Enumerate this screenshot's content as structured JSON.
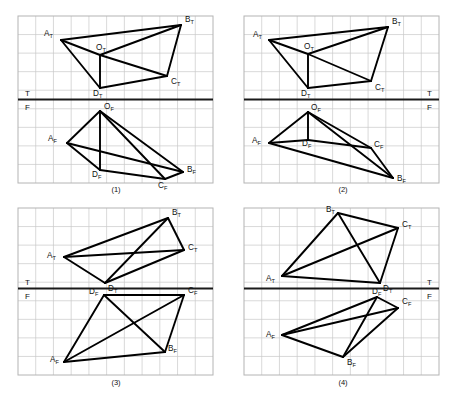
{
  "figure": {
    "type": "engineering-drawing",
    "background_color": "#ffffff",
    "grid_color": "#c8c8c8",
    "line_color": "#000000",
    "ground_line_color": "#1a1a1a"
  },
  "panels": [
    {
      "id": "panel-1",
      "caption": "(1)",
      "caption_pos": {
        "x": 116,
        "y": 192
      },
      "frame": {
        "x": 18,
        "y": 16,
        "w": 195,
        "h": 167
      },
      "grid": {
        "cols": 11,
        "rows": 9
      },
      "ground_line": {
        "x1": 18,
        "y1": 99.5,
        "x2": 213,
        "y2": 99.5
      },
      "tf_labels": [
        {
          "text": "T",
          "x": 25,
          "y": 96
        },
        {
          "text": "F",
          "x": 25,
          "y": 110
        }
      ],
      "top_view": {
        "points": {
          "A_T": {
            "x": 61,
            "y": 40
          },
          "B_T": {
            "x": 181,
            "y": 25
          },
          "C_T": {
            "x": 167,
            "y": 76
          },
          "D_T": {
            "x": 100,
            "y": 88
          },
          "O_T": {
            "x": 100,
            "y": 55
          }
        },
        "edges": [
          [
            "A_T",
            "B_T"
          ],
          [
            "B_T",
            "C_T"
          ],
          [
            "C_T",
            "D_T"
          ],
          [
            "D_T",
            "A_T"
          ],
          [
            "A_T",
            "O_T"
          ],
          [
            "B_T",
            "O_T"
          ],
          [
            "C_T",
            "O_T"
          ],
          [
            "D_T",
            "O_T"
          ]
        ],
        "labels": [
          {
            "key": "A_T",
            "base": "A",
            "sub": "T",
            "x": 44,
            "y": 36
          },
          {
            "key": "B_T",
            "base": "B",
            "sub": "T",
            "x": 185,
            "y": 22
          },
          {
            "key": "C_T",
            "base": "C",
            "sub": "T",
            "x": 171,
            "y": 84
          },
          {
            "key": "D_T",
            "base": "D",
            "sub": "T",
            "x": 93,
            "y": 96
          },
          {
            "key": "O_T",
            "base": "O",
            "sub": "T",
            "x": 96,
            "y": 50
          }
        ]
      },
      "front_view": {
        "points": {
          "A_F": {
            "x": 67,
            "y": 143
          },
          "B_F": {
            "x": 183,
            "y": 172
          },
          "C_F": {
            "x": 165,
            "y": 179
          },
          "D_F": {
            "x": 100,
            "y": 170
          },
          "O_F": {
            "x": 100,
            "y": 111
          }
        },
        "edges": [
          [
            "A_F",
            "B_F"
          ],
          [
            "B_F",
            "C_F"
          ],
          [
            "C_F",
            "D_F"
          ],
          [
            "D_F",
            "A_F"
          ],
          [
            "A_F",
            "O_F"
          ],
          [
            "B_F",
            "O_F"
          ],
          [
            "C_F",
            "O_F"
          ],
          [
            "D_F",
            "O_F"
          ]
        ],
        "labels": [
          {
            "key": "A_F",
            "base": "A",
            "sub": "F",
            "x": 48,
            "y": 141
          },
          {
            "key": "B_F",
            "base": "B",
            "sub": "F",
            "x": 187,
            "y": 172
          },
          {
            "key": "C_F",
            "base": "C",
            "sub": "F",
            "x": 158,
            "y": 188
          },
          {
            "key": "D_F",
            "base": "D",
            "sub": "F",
            "x": 92,
            "y": 177
          },
          {
            "key": "O_F",
            "base": "O",
            "sub": "F",
            "x": 104,
            "y": 109
          }
        ]
      }
    },
    {
      "id": "panel-2",
      "caption": "(2)",
      "caption_pos": {
        "x": 343,
        "y": 192
      },
      "frame": {
        "x": 244,
        "y": 16,
        "w": 195,
        "h": 167
      },
      "grid": {
        "cols": 11,
        "rows": 9
      },
      "ground_line": {
        "x1": 244,
        "y1": 99.5,
        "x2": 439,
        "y2": 99.5
      },
      "tf_labels": [
        {
          "text": "T",
          "x": 427,
          "y": 96
        },
        {
          "text": "F",
          "x": 427,
          "y": 110
        }
      ],
      "top_view": {
        "points": {
          "A_T": {
            "x": 269,
            "y": 40
          },
          "B_T": {
            "x": 388,
            "y": 27
          },
          "C_T": {
            "x": 371,
            "y": 81
          },
          "D_T": {
            "x": 308,
            "y": 88
          },
          "O_T": {
            "x": 308,
            "y": 54
          }
        },
        "edges": [
          [
            "A_T",
            "B_T"
          ],
          [
            "B_T",
            "C_T"
          ],
          [
            "C_T",
            "D_T"
          ],
          [
            "D_T",
            "A_T"
          ],
          [
            "A_T",
            "O_T"
          ],
          [
            "B_T",
            "O_T"
          ],
          [
            "C_T",
            "O_T"
          ],
          [
            "D_T",
            "O_T"
          ]
        ],
        "labels": [
          {
            "key": "A_T",
            "base": "A",
            "sub": "T",
            "x": 253,
            "y": 37
          },
          {
            "key": "B_T",
            "base": "B",
            "sub": "T",
            "x": 392,
            "y": 24
          },
          {
            "key": "C_T",
            "base": "C",
            "sub": "T",
            "x": 375,
            "y": 90
          },
          {
            "key": "D_T",
            "base": "D",
            "sub": "T",
            "x": 301,
            "y": 96
          },
          {
            "key": "O_T",
            "base": "O",
            "sub": "T",
            "x": 304,
            "y": 49
          }
        ]
      },
      "front_view": {
        "points": {
          "A_F": {
            "x": 269,
            "y": 143
          },
          "B_F": {
            "x": 393,
            "y": 178
          },
          "C_F": {
            "x": 371,
            "y": 148
          },
          "D_F": {
            "x": 308,
            "y": 140
          },
          "O_F": {
            "x": 308,
            "y": 112
          }
        },
        "edges": [
          [
            "A_F",
            "B_F"
          ],
          [
            "B_F",
            "C_F"
          ],
          [
            "C_F",
            "D_F"
          ],
          [
            "D_F",
            "A_F"
          ],
          [
            "A_F",
            "O_F"
          ],
          [
            "B_F",
            "O_F"
          ],
          [
            "C_F",
            "O_F"
          ],
          [
            "D_F",
            "O_F"
          ]
        ],
        "labels": [
          {
            "key": "A_F",
            "base": "A",
            "sub": "F",
            "x": 252,
            "y": 143
          },
          {
            "key": "B_F",
            "base": "B",
            "sub": "F",
            "x": 397,
            "y": 181
          },
          {
            "key": "C_F",
            "base": "C",
            "sub": "F",
            "x": 374,
            "y": 147
          },
          {
            "key": "D_F",
            "base": "D",
            "sub": "F",
            "x": 302,
            "y": 146
          },
          {
            "key": "O_F",
            "base": "O",
            "sub": "F",
            "x": 311,
            "y": 110
          }
        ]
      }
    },
    {
      "id": "panel-3",
      "caption": "(3)",
      "caption_pos": {
        "x": 116,
        "y": 385
      },
      "frame": {
        "x": 18,
        "y": 208,
        "w": 195,
        "h": 167
      },
      "grid": {
        "cols": 11,
        "rows": 9
      },
      "ground_line": {
        "x1": 18,
        "y1": 288.5,
        "x2": 213,
        "y2": 288.5
      },
      "tf_labels": [
        {
          "text": "T",
          "x": 25,
          "y": 285
        },
        {
          "text": "F",
          "x": 25,
          "y": 299
        }
      ],
      "top_view": {
        "points": {
          "A_T": {
            "x": 64,
            "y": 257
          },
          "B_T": {
            "x": 168,
            "y": 218
          },
          "C_T": {
            "x": 184,
            "y": 250
          },
          "D_T": {
            "x": 105,
            "y": 283
          }
        },
        "edges": [
          [
            "A_T",
            "B_T"
          ],
          [
            "B_T",
            "C_T"
          ],
          [
            "C_T",
            "D_T"
          ],
          [
            "D_T",
            "A_T"
          ],
          [
            "A_T",
            "C_T"
          ],
          [
            "B_T",
            "D_T"
          ]
        ],
        "labels": [
          {
            "key": "A_T",
            "base": "A",
            "sub": "T",
            "x": 47,
            "y": 258
          },
          {
            "key": "B_T",
            "base": "B",
            "sub": "T",
            "x": 172,
            "y": 215
          },
          {
            "key": "C_T",
            "base": "C",
            "sub": "T",
            "x": 188,
            "y": 250
          },
          {
            "key": "D_T",
            "base": "D",
            "sub": "T",
            "x": 108,
            "y": 291
          }
        ]
      },
      "front_view": {
        "points": {
          "A_F": {
            "x": 64,
            "y": 362
          },
          "B_F": {
            "x": 165,
            "y": 352
          },
          "C_F": {
            "x": 184,
            "y": 295
          },
          "D_F": {
            "x": 104,
            "y": 295
          }
        },
        "edges": [
          [
            "A_F",
            "B_F"
          ],
          [
            "B_F",
            "C_F"
          ],
          [
            "C_F",
            "D_F"
          ],
          [
            "D_F",
            "A_F"
          ],
          [
            "A_F",
            "C_F"
          ],
          [
            "B_F",
            "D_F"
          ]
        ],
        "labels": [
          {
            "key": "A_F",
            "base": "A",
            "sub": "F",
            "x": 50,
            "y": 362
          },
          {
            "key": "B_F",
            "base": "B",
            "sub": "F",
            "x": 168,
            "y": 351
          },
          {
            "key": "C_F",
            "base": "C",
            "sub": "F",
            "x": 188,
            "y": 293
          },
          {
            "key": "D_F",
            "base": "D",
            "sub": "F",
            "x": 89,
            "y": 294
          }
        ]
      }
    },
    {
      "id": "panel-4",
      "caption": "(4)",
      "caption_pos": {
        "x": 343,
        "y": 385
      },
      "frame": {
        "x": 244,
        "y": 208,
        "w": 195,
        "h": 167
      },
      "grid": {
        "cols": 11,
        "rows": 9
      },
      "ground_line": {
        "x1": 244,
        "y1": 288.5,
        "x2": 439,
        "y2": 288.5
      },
      "tf_labels": [
        {
          "text": "T",
          "x": 427,
          "y": 285
        },
        {
          "text": "F",
          "x": 427,
          "y": 299
        }
      ],
      "top_view": {
        "points": {
          "A_T": {
            "x": 282,
            "y": 276
          },
          "B_T": {
            "x": 338,
            "y": 213
          },
          "C_T": {
            "x": 398,
            "y": 228
          },
          "D_T": {
            "x": 380,
            "y": 283
          }
        },
        "edges": [
          [
            "A_T",
            "B_T"
          ],
          [
            "B_T",
            "C_T"
          ],
          [
            "C_T",
            "D_T"
          ],
          [
            "D_T",
            "A_T"
          ],
          [
            "A_T",
            "C_T"
          ],
          [
            "B_T",
            "D_T"
          ]
        ],
        "labels": [
          {
            "key": "A_T",
            "base": "A",
            "sub": "T",
            "x": 266,
            "y": 281
          },
          {
            "key": "B_T",
            "base": "B",
            "sub": "T",
            "x": 326,
            "y": 212
          },
          {
            "key": "C_T",
            "base": "C",
            "sub": "T",
            "x": 402,
            "y": 227
          },
          {
            "key": "D_T",
            "base": "D",
            "sub": "T",
            "x": 383,
            "y": 291
          }
        ]
      },
      "front_view": {
        "points": {
          "A_F": {
            "x": 282,
            "y": 335
          },
          "B_F": {
            "x": 343,
            "y": 357
          },
          "C_F": {
            "x": 398,
            "y": 308
          },
          "D_F": {
            "x": 377,
            "y": 297
          }
        },
        "edges": [
          [
            "A_F",
            "B_F"
          ],
          [
            "B_F",
            "C_F"
          ],
          [
            "C_F",
            "D_F"
          ],
          [
            "D_F",
            "A_F"
          ],
          [
            "A_F",
            "C_F"
          ],
          [
            "B_F",
            "D_F"
          ]
        ],
        "labels": [
          {
            "key": "A_F",
            "base": "A",
            "sub": "F",
            "x": 266,
            "y": 337
          },
          {
            "key": "B_F",
            "base": "B",
            "sub": "F",
            "x": 347,
            "y": 365
          },
          {
            "key": "C_F",
            "base": "C",
            "sub": "F",
            "x": 402,
            "y": 304
          },
          {
            "key": "D_F",
            "base": "D",
            "sub": "F",
            "x": 372,
            "y": 294
          }
        ]
      }
    }
  ]
}
